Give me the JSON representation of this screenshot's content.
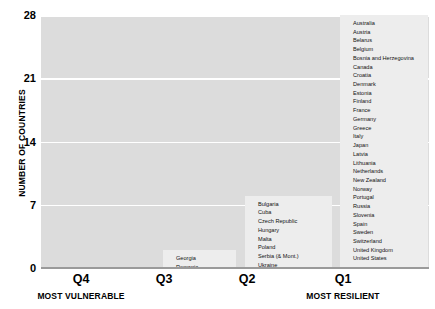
{
  "chart_data": {
    "type": "bar",
    "title": "",
    "xlabel": "",
    "ylabel": "NUMBER OF COUNTRIES",
    "categories": [
      "Q4",
      "Q3",
      "Q2",
      "Q1"
    ],
    "values": [
      0,
      2,
      8,
      28
    ],
    "ylim": [
      0,
      28
    ],
    "yticks": [
      0,
      7,
      14,
      21,
      28
    ],
    "grid": true,
    "legend": false,
    "category_sublabels": [
      "MOST VULNERABLE",
      "",
      "",
      "MOST RESILIENT"
    ],
    "bar_item_labels": [
      [],
      [
        "Georgia",
        "Romania"
      ],
      [
        "Bulgaria",
        "Cuba",
        "Czech Republic",
        "Hungary",
        "Malta",
        "Poland",
        "Serbia (& Mont.)",
        "Ukraine"
      ],
      [
        "Australia",
        "Austria",
        "Belarus",
        "Belgium",
        "Bosnia and Herzegovina",
        "Canada",
        "Croatia",
        "Denmark",
        "Estonia",
        "Finland",
        "France",
        "Germany",
        "Greece",
        "Italy",
        "Japan",
        "Latvia",
        "Lithuania",
        "Netherlands",
        "New Zealand",
        "Norway",
        "Portugal",
        "Russia",
        "Slovenia",
        "Spain",
        "Sweden",
        "Switzerland",
        "United Kingdom",
        "United States"
      ]
    ],
    "colors": {
      "plot_background": "#dcdcdc",
      "bar_fill": "#ededed",
      "gridline": "#ffffff",
      "text": "#000000"
    }
  },
  "axis": {
    "y_title": "NUMBER OF COUNTRIES",
    "y_tick_0": "0",
    "y_tick_7": "7",
    "y_tick_14": "14",
    "y_tick_21": "21",
    "y_tick_28": "28"
  },
  "x_axis": {
    "q4": "Q4",
    "q3": "Q3",
    "q2": "Q2",
    "q1": "Q1",
    "most_vulnerable": "MOST VULNERABLE",
    "most_resilient": "MOST RESILIENT"
  }
}
